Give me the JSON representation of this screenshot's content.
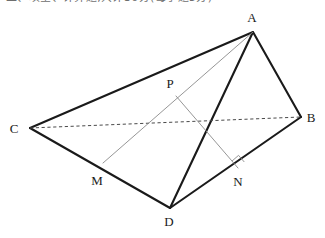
{
  "page": {
    "width": 325,
    "height": 238,
    "background_color": "#ffffff"
  },
  "heading": {
    "text": "二、填空、计算题,共计30分(每小题5分)",
    "note": "clipped-top-text-row",
    "color": "#6e6e6e"
  },
  "figure": {
    "name": "tetrahedron-projection-diagram",
    "colors": {
      "solid_edge": "#1a1a1a",
      "hidden_edge": "#4a4a4a",
      "construction_line": "#8a8a8a",
      "label": "#1a1a1a"
    },
    "stroke_widths": {
      "solid_edge": 2.1,
      "hidden_edge": 1.0,
      "construction_line": 0.9,
      "right_angle": 0.9
    },
    "points": [
      {
        "id": "A",
        "label": "A",
        "x": 253,
        "y": 32,
        "label_x": 252,
        "label_y": 22
      },
      {
        "id": "B",
        "label": "B",
        "x": 301,
        "y": 117,
        "label_x": 311,
        "label_y": 122
      },
      {
        "id": "C",
        "label": "C",
        "x": 30,
        "y": 128,
        "label_x": 14,
        "label_y": 133
      },
      {
        "id": "D",
        "label": "D",
        "x": 170,
        "y": 208,
        "label_x": 165,
        "label_y": 226
      },
      {
        "id": "M",
        "label": "M",
        "x": 103,
        "y": 163,
        "label_x": 91,
        "label_y": 185
      },
      {
        "id": "N",
        "label": "N",
        "x": 238,
        "y": 168,
        "label_x": 232,
        "label_y": 186
      },
      {
        "id": "P",
        "label": "P",
        "x": 176,
        "y": 96,
        "label_x": 166,
        "label_y": 88
      }
    ],
    "edges": [
      {
        "id": "AC",
        "from": "A",
        "to": "C",
        "style": "solid"
      },
      {
        "id": "AD",
        "from": "A",
        "to": "D",
        "style": "solid"
      },
      {
        "id": "AB",
        "from": "A",
        "to": "B",
        "style": "solid"
      },
      {
        "id": "CD",
        "from": "C",
        "to": "D",
        "style": "solid"
      },
      {
        "id": "DB",
        "from": "D",
        "to": "B",
        "style": "solid"
      },
      {
        "id": "CB",
        "from": "C",
        "to": "B",
        "style": "dashed"
      },
      {
        "id": "AM",
        "from": "A",
        "to": "M",
        "style": "construction"
      },
      {
        "id": "PN",
        "from": "P",
        "to": "N",
        "style": "construction"
      }
    ],
    "right_angle_markers": [
      {
        "id": "angle-PND",
        "at": "N",
        "size": 9
      }
    ]
  }
}
